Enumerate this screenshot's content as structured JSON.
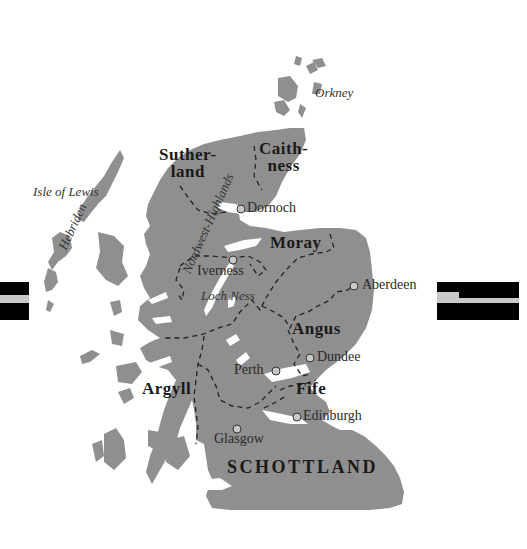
{
  "map": {
    "country_label": "SCHOTTLAND",
    "land_color": "#8f8f8f",
    "water_color": "#ffffff",
    "border_style": "dashed",
    "regions": [
      {
        "id": "sutherland",
        "line1": "Suther-",
        "line2": "land"
      },
      {
        "id": "caithness",
        "line1": "Caith-",
        "line2": "ness"
      },
      {
        "id": "moray",
        "label": "Moray"
      },
      {
        "id": "angus",
        "label": "Angus"
      },
      {
        "id": "argyll",
        "label": "Argyll"
      },
      {
        "id": "fife",
        "label": "Fife"
      }
    ],
    "cities": [
      {
        "id": "dornoch",
        "label": "Dornoch"
      },
      {
        "id": "iverness",
        "label": "Iverness"
      },
      {
        "id": "aberdeen",
        "label": "Aberdeen"
      },
      {
        "id": "dundee",
        "label": "Dundee"
      },
      {
        "id": "perth",
        "label": "Perth"
      },
      {
        "id": "edinburgh",
        "label": "Edinburgh"
      },
      {
        "id": "glasgow",
        "label": "Glasgow"
      }
    ],
    "features": [
      {
        "id": "orkney",
        "label": "Orkney"
      },
      {
        "id": "isle-of-lewis",
        "label": "Isle of Lewis"
      },
      {
        "id": "hebriden",
        "label": "Hebriden"
      },
      {
        "id": "loch-ness",
        "label": "Loch Ness"
      },
      {
        "id": "northwest-highlands",
        "label": "Nordwest-Highlands"
      }
    ]
  }
}
